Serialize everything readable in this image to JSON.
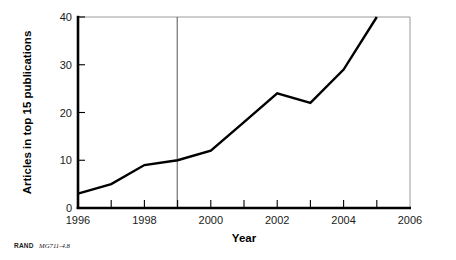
{
  "figure": {
    "credit_source": "RAND",
    "credit_id": "MG711-4.8"
  },
  "chart_data": {
    "type": "line",
    "title": "",
    "xlabel": "Year",
    "ylabel": "Articles in top 15 publications",
    "xlim": [
      1996,
      2006
    ],
    "ylim": [
      0,
      40
    ],
    "grid": false,
    "legend": "none",
    "x_ticks_major": [
      1996,
      1998,
      2000,
      2002,
      2004,
      2006
    ],
    "x_ticks_minor": [
      1997,
      1999,
      2001,
      2003,
      2005
    ],
    "x_tick_labels": [
      "1996",
      "1998",
      "2000",
      "2002",
      "2004",
      "2006"
    ],
    "y_ticks": [
      0,
      10,
      20,
      30,
      40
    ],
    "y_tick_labels": [
      "0",
      "10",
      "20",
      "30",
      "40"
    ],
    "x": [
      1996,
      1997,
      1998,
      1999,
      2000,
      2001,
      2002,
      2003,
      2004,
      2005
    ],
    "values": [
      3,
      5,
      9,
      10,
      12,
      18,
      24,
      22,
      29,
      40
    ],
    "series": [
      {
        "name": "Articles in top 15 publications",
        "x": [
          1996,
          1997,
          1998,
          1999,
          2000,
          2001,
          2002,
          2003,
          2004,
          2005
        ],
        "values": [
          3,
          5,
          9,
          10,
          12,
          18,
          24,
          22,
          29,
          40
        ],
        "color": "#000000"
      }
    ],
    "annotations": [
      {
        "type": "vertical-reference-line",
        "x": 1999,
        "color": "#555555",
        "label": ""
      }
    ],
    "colors": {
      "line": "#000000",
      "axis": "#000000",
      "frame": "#999999",
      "reference_line": "#555555",
      "background": "#ffffff"
    }
  }
}
